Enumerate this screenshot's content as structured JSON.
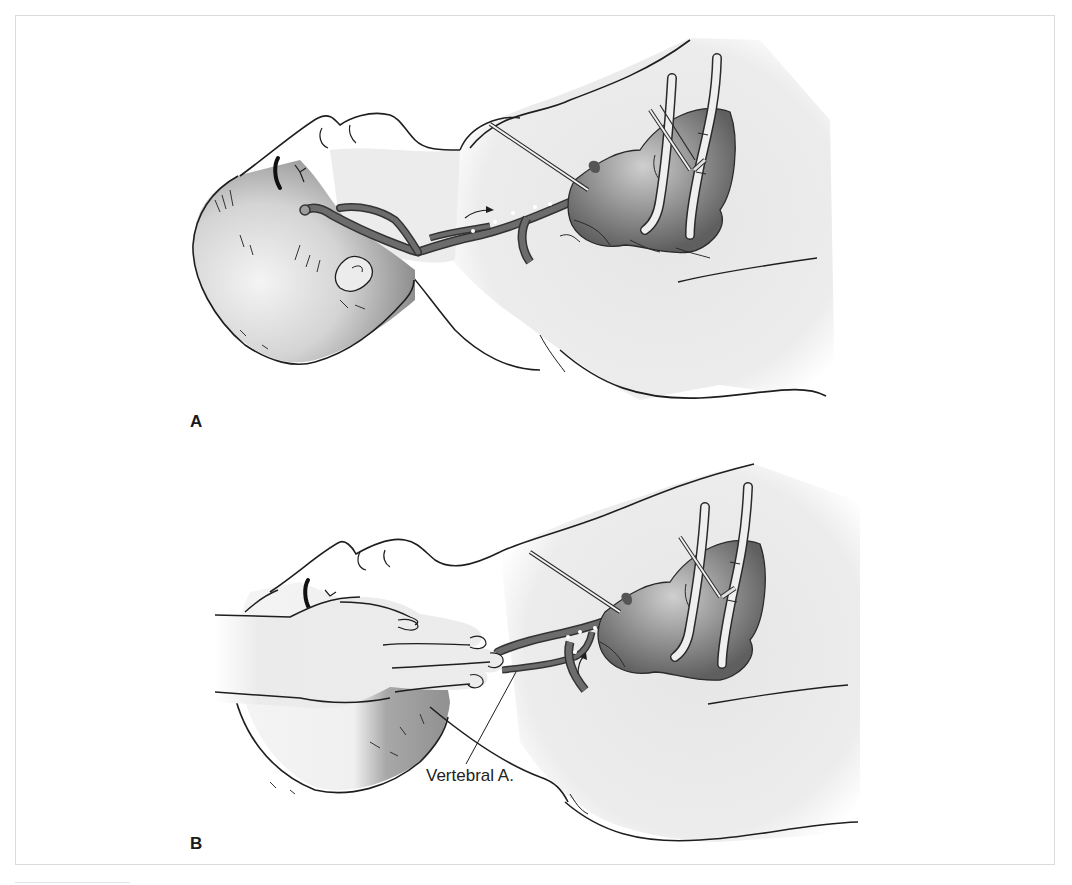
{
  "figure": {
    "panels": [
      {
        "id": "A",
        "label": "A",
        "callouts": []
      },
      {
        "id": "B",
        "label": "B",
        "callouts": [
          {
            "text": "Vertebral A.",
            "target": "vertebral-artery"
          }
        ]
      }
    ]
  },
  "colors": {
    "line": "#1e1e1e",
    "skin": "#ececec",
    "hair_shade": "#9a9a9a",
    "vessel": "#6a6a6a",
    "heart": "#7d7d7d",
    "frame": "#dcdcdc"
  }
}
